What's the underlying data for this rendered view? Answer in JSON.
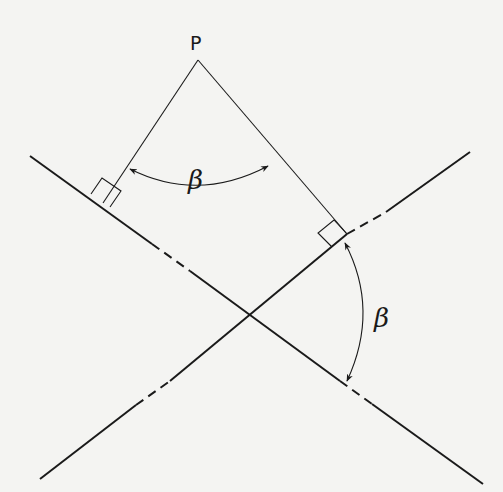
{
  "diagram": {
    "point_label": "P",
    "angle_label_top": "β",
    "angle_label_right": "β",
    "colors": {
      "ink": "#1a1a1a",
      "background": "#f4f4f2"
    }
  }
}
